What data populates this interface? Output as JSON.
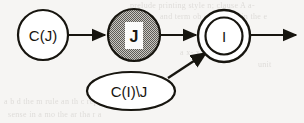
{
  "figure": {
    "caption_present": false,
    "background_color": "#f6f5f3",
    "ink_color": "#17150f",
    "shaded_fill_color": "#a9a7a2"
  },
  "nodes": [
    {
      "id": "c-of-j",
      "label": "C(J)",
      "shape": "circle",
      "fill": "white",
      "cx": 43,
      "cy": 35,
      "r": 25
    },
    {
      "id": "j",
      "label": "J",
      "shape": "circle",
      "fill": "shaded",
      "cx": 134,
      "cy": 35,
      "r": 26
    },
    {
      "id": "i",
      "label": "I",
      "shape": "double-circle",
      "fill": "white",
      "cx": 224,
      "cy": 36,
      "r": 26,
      "r_inner": 18
    },
    {
      "id": "c-of-i-minus-j",
      "label": "C(I)\\J",
      "shape": "ellipse",
      "fill": "white",
      "cx": 131,
      "cy": 91,
      "rx": 44,
      "ry": 19
    }
  ],
  "edges": [
    {
      "id": "edge-cj-to-j",
      "from": "c-of-j",
      "to": "j",
      "style": "solid-arrow"
    },
    {
      "id": "edge-j-to-i",
      "from": "j",
      "to": "i",
      "style": "solid-arrow"
    },
    {
      "id": "edge-cij-to-i",
      "from": "c-of-i-minus-j",
      "to": "i",
      "style": "solid-arrow"
    },
    {
      "id": "edge-i-outgoing",
      "from": "i",
      "to": null,
      "style": "solid-arrow"
    }
  ],
  "background_text": {
    "line_top_1": "prelude printing style n; clause A a-",
    "line_top_2": "and term ob a constant in the e",
    "line_mid_1": "a x- x  y , u  o-",
    "line_mid_2": "unit",
    "line_bottom_1": "a    b  d  the  m rule  an  th  c rep n",
    "line_bottom_2": "sense  in  a  mo  the  ar   tha  r   a"
  }
}
